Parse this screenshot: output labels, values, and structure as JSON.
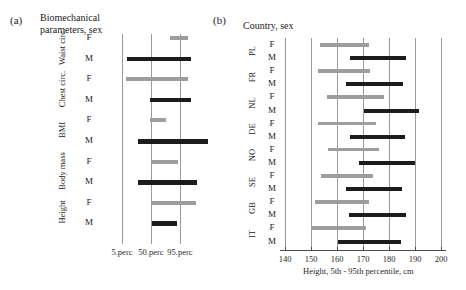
{
  "panels": {
    "a": {
      "tag": "(a)",
      "title": "Biomechanical\nparameters, sex",
      "title_line1": "Biomechanical",
      "title_line2": "parameters, sex",
      "axis_labels": [
        "5.perc",
        "50.perc",
        "95.perc"
      ]
    },
    "b": {
      "tag": "(b)",
      "title": "Country, sex",
      "axis_title": "Height,  5th - 95th percentile, cm",
      "tick_labels": [
        "140",
        "150",
        "160",
        "170",
        "180",
        "190",
        "200"
      ]
    }
  },
  "colors": {
    "male": "#1c1c1c",
    "female": "#9d9d9d",
    "gridline": "#9a9a9a",
    "axis": "#4a4a4a",
    "background": "#ffffff"
  },
  "chart_data": [
    {
      "type": "bar",
      "orientation": "horizontal",
      "subtype": "range-bar",
      "panel": "(a)",
      "title": "Biomechanical parameters, sex",
      "xlabel": "",
      "ylabel": "",
      "grid": true,
      "xticks": [
        5,
        50,
        95
      ],
      "xtick_labels": [
        "5.perc",
        "50.perc",
        "95.perc"
      ],
      "xlim": [
        0,
        115
      ],
      "note": "x positions are relative percentile-grid units; bars show 5th-95th percentile range of each parameter, normalised",
      "legend": [
        "F = female (light grey)",
        "M = male (black)"
      ],
      "groups": [
        "Waist circ.",
        "Chest circ.",
        "BMI",
        "Body mass",
        "Height"
      ],
      "categories": [
        "Waist circ. F",
        "Waist circ. M",
        "Chest circ. F",
        "Chest circ. M",
        "BMI F",
        "BMI M",
        "Body mass F",
        "Body mass M",
        "Height F",
        "Height M"
      ],
      "series": [
        {
          "name": "Waist circ.",
          "bars": [
            {
              "sex": "F",
              "start": 79,
              "end": 107
            },
            {
              "sex": "M",
              "start": 13,
              "end": 112
            }
          ]
        },
        {
          "name": "Chest circ.",
          "bars": [
            {
              "sex": "F",
              "start": 11,
              "end": 107
            },
            {
              "sex": "M",
              "start": 49,
              "end": 112
            }
          ]
        },
        {
          "name": "BMI",
          "bars": [
            {
              "sex": "F",
              "start": 49,
              "end": 73
            },
            {
              "sex": "M",
              "start": 30,
              "end": 138
            }
          ]
        },
        {
          "name": "Body mass",
          "bars": [
            {
              "sex": "F",
              "start": 51,
              "end": 92
            },
            {
              "sex": "M",
              "start": 30,
              "end": 121
            }
          ]
        },
        {
          "name": "Height",
          "bars": [
            {
              "sex": "F",
              "start": 51,
              "end": 120
            },
            {
              "sex": "M",
              "start": 51,
              "end": 91
            }
          ]
        }
      ]
    },
    {
      "type": "bar",
      "orientation": "horizontal",
      "subtype": "range-bar",
      "panel": "(b)",
      "title": "Country, sex",
      "xlabel": "Height,  5th - 95th percentile, cm",
      "ylabel": "",
      "grid": true,
      "xlim": [
        138,
        202
      ],
      "xticks": [
        140,
        150,
        160,
        170,
        180,
        190,
        200
      ],
      "xtick_labels": [
        "140",
        "150",
        "160",
        "170",
        "180",
        "190",
        "200"
      ],
      "legend": [
        "F = female (light grey)",
        "M = male (black)"
      ],
      "groups": [
        "PL",
        "FR",
        "NL",
        "DE",
        "NO",
        "SE",
        "GB",
        "IT"
      ],
      "categories": [
        "PL F",
        "PL M",
        "FR F",
        "FR M",
        "NL F",
        "NL M",
        "DE F",
        "DE M",
        "NO F",
        "NO M",
        "SE F",
        "SE M",
        "GB F",
        "GB M",
        "IT F",
        "IT M"
      ],
      "series": [
        {
          "name": "PL",
          "bars": [
            {
              "sex": "F",
              "start": 153.5,
              "end": 172.5
            },
            {
              "sex": "M",
              "start": 165.0,
              "end": 186.5
            }
          ]
        },
        {
          "name": "FR",
          "bars": [
            {
              "sex": "F",
              "start": 152.5,
              "end": 172.5
            },
            {
              "sex": "M",
              "start": 163.5,
              "end": 185.5
            }
          ]
        },
        {
          "name": "NL",
          "bars": [
            {
              "sex": "F",
              "start": 156.0,
              "end": 178.0
            },
            {
              "sex": "M",
              "start": 170.5,
              "end": 191.5
            }
          ]
        },
        {
          "name": "DE",
          "bars": [
            {
              "sex": "F",
              "start": 152.5,
              "end": 175.0
            },
            {
              "sex": "M",
              "start": 165.0,
              "end": 186.0
            }
          ]
        },
        {
          "name": "NO",
          "bars": [
            {
              "sex": "F",
              "start": 156.5,
              "end": 176.0
            },
            {
              "sex": "M",
              "start": 168.5,
              "end": 190.0
            }
          ]
        },
        {
          "name": "SE",
          "bars": [
            {
              "sex": "F",
              "start": 154.0,
              "end": 174.0
            },
            {
              "sex": "M",
              "start": 163.5,
              "end": 185.0
            }
          ]
        },
        {
          "name": "GB",
          "bars": [
            {
              "sex": "F",
              "start": 151.5,
              "end": 172.5
            },
            {
              "sex": "M",
              "start": 164.5,
              "end": 186.5
            }
          ]
        },
        {
          "name": "IT",
          "bars": [
            {
              "sex": "F",
              "start": 150.0,
              "end": 171.0
            },
            {
              "sex": "M",
              "start": 160.5,
              "end": 184.5
            }
          ]
        }
      ]
    }
  ]
}
